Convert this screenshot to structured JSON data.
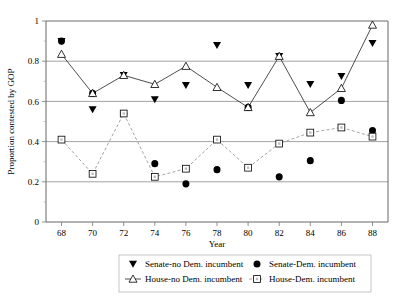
{
  "chart_data": {
    "type": "line",
    "title": "",
    "xlabel": "Year",
    "ylabel": "Proportion contested by GOP",
    "x": [
      68,
      70,
      72,
      74,
      76,
      78,
      80,
      82,
      84,
      86,
      88
    ],
    "xticklabels": [
      "68",
      "70",
      "72",
      "74",
      "76",
      "78",
      "80",
      "82",
      "84",
      "86",
      "88"
    ],
    "yticklabels": [
      "0",
      "0.2",
      "0.4",
      "0.6",
      "0.8",
      "1"
    ],
    "ytickvalues": [
      0,
      0.2,
      0.4,
      0.6,
      0.8,
      1
    ],
    "xlim": [
      67,
      89
    ],
    "ylim": [
      0,
      1
    ],
    "grid": "horizontal",
    "legend_position": "bottom",
    "series": [
      {
        "name": "Senate-no Dem. incumbent",
        "marker": "filled-triangle-down",
        "line": "none",
        "color": "#000000",
        "values": [
          0.9,
          0.56,
          0.73,
          0.61,
          0.68,
          0.88,
          0.68,
          0.825,
          0.685,
          0.725,
          0.89
        ]
      },
      {
        "name": "Senate-Dem. incumbent",
        "marker": "filled-circle",
        "line": "none",
        "color": "#000000",
        "values": [
          0.9,
          0.64,
          0.54,
          0.29,
          0.19,
          0.26,
          0.57,
          0.225,
          0.305,
          0.605,
          0.455
        ]
      },
      {
        "name": "House-no Dem. incumbent",
        "marker": "open-triangle-up",
        "line": "solid",
        "color": "#3a3a3a",
        "values": [
          0.835,
          0.64,
          0.73,
          0.685,
          0.775,
          0.67,
          0.57,
          0.825,
          0.545,
          0.665,
          0.98
        ]
      },
      {
        "name": "House-Dem. incumbent",
        "marker": "open-square",
        "line": "dashed",
        "color": "#9a9a9a",
        "values": [
          0.41,
          0.24,
          0.54,
          0.225,
          0.265,
          0.41,
          0.27,
          0.39,
          0.445,
          0.47,
          0.425
        ]
      }
    ]
  },
  "legend": {
    "items": [
      {
        "label": "Senate-no Dem. incumbent",
        "marker": "filled-triangle-down"
      },
      {
        "label": "Senate-Dem. incumbent",
        "marker": "filled-circle"
      },
      {
        "label": "House-no Dem. incumbent",
        "marker": "open-triangle-up"
      },
      {
        "label": "House-Dem. incumbent",
        "marker": "open-square"
      }
    ]
  }
}
